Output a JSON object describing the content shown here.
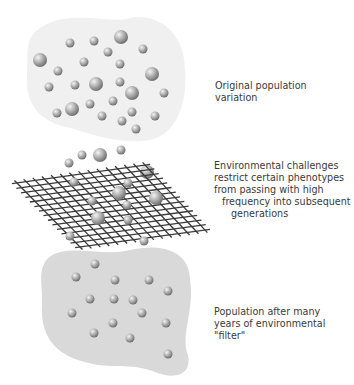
{
  "labels": {
    "original": {
      "lines": [
        "Original population",
        "variation"
      ]
    },
    "challenge": {
      "lines": [
        "Environmental challenges",
        "restrict certain phenotypes",
        "from passing with high",
        "frequency into subsequent",
        "generations"
      ]
    },
    "after": {
      "lines": [
        "Population after many",
        "years of environmental",
        "\"filter\""
      ]
    }
  },
  "colors": {
    "blob_top": "#f0f0f0",
    "blob_bottom": "#d9d9d9",
    "grid": "#3a3a3a",
    "sphere_light": "#e6e6e6",
    "sphere_dark": "#7a7a7a",
    "text": "#3a3a3a"
  },
  "top_spheres": [
    [
      40,
      60,
      7
    ],
    [
      70,
      43,
      4.5
    ],
    [
      94,
      41,
      4.5
    ],
    [
      121,
      37,
      7
    ],
    [
      108,
      52,
      4.5
    ],
    [
      143,
      49,
      4.5
    ],
    [
      58,
      71,
      4.5
    ],
    [
      84,
      62,
      4.5
    ],
    [
      120,
      64,
      4.5
    ],
    [
      152,
      74,
      7
    ],
    [
      49,
      87,
      4.5
    ],
    [
      75,
      85,
      4.5
    ],
    [
      96,
      84,
      7
    ],
    [
      120,
      82,
      4.5
    ],
    [
      132,
      93,
      7
    ],
    [
      164,
      93,
      4.5
    ],
    [
      57,
      113,
      4.5
    ],
    [
      72,
      109,
      7
    ],
    [
      90,
      104,
      4.5
    ],
    [
      113,
      101,
      4.5
    ],
    [
      102,
      116,
      4.5
    ],
    [
      132,
      112,
      4.5
    ],
    [
      122,
      121,
      4.5
    ],
    [
      155,
      116,
      4.5
    ],
    [
      136,
      129,
      4.5
    ]
  ],
  "falling_spheres": [
    [
      82,
      155,
      4.5
    ],
    [
      100,
      155,
      7
    ],
    [
      121,
      150,
      4.5
    ],
    [
      69,
      163,
      4.5
    ],
    [
      147,
      172,
      7
    ]
  ],
  "grid_spheres": [
    [
      74,
      182,
      4.5
    ],
    [
      128,
      183,
      4.5
    ],
    [
      119,
      193,
      7
    ],
    [
      156,
      198,
      7
    ],
    [
      92,
      201,
      4.5
    ],
    [
      127,
      205,
      4.5
    ],
    [
      98,
      218,
      7
    ],
    [
      128,
      220,
      4.5
    ],
    [
      70,
      236,
      4.5
    ],
    [
      144,
      241,
      4.5
    ]
  ],
  "bottom_spheres": [
    [
      95,
      264,
      4.5
    ],
    [
      76,
      277,
      4.5
    ],
    [
      115,
      280,
      4.5
    ],
    [
      149,
      280,
      4.5
    ],
    [
      168,
      291,
      4.5
    ],
    [
      90,
      299,
      4.5
    ],
    [
      114,
      299,
      4.5
    ],
    [
      133,
      300,
      4.5
    ],
    [
      72,
      313,
      4.5
    ],
    [
      142,
      313,
      4.5
    ],
    [
      113,
      323,
      4.5
    ],
    [
      166,
      323,
      4.5
    ],
    [
      94,
      333,
      4.5
    ],
    [
      130,
      338,
      4.5
    ],
    [
      168,
      354,
      4.5
    ]
  ],
  "grid": {
    "corners": {
      "left": [
        17,
        183
      ],
      "top": [
        145,
        165
      ],
      "right": [
        205,
        230
      ],
      "bottom": [
        80,
        247
      ]
    },
    "divisions": 14
  }
}
